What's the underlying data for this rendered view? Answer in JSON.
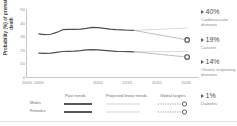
{
  "chart_data": {
    "type": "line",
    "title": "",
    "xlabel": "",
    "ylabel": "Probability (%) of premature death",
    "xlim": [
      1998,
      2027
    ],
    "ylim": [
      0,
      50
    ],
    "grid": false,
    "legend_position": "below",
    "yticks": [
      50,
      40,
      30,
      20,
      10,
      0
    ],
    "xticks": [
      2000,
      2005,
      2010,
      2015,
      2020,
      2025
    ],
    "series": [
      {
        "name": "Males past trends",
        "style": "solid-dark",
        "x": [
          2000,
          2001,
          2002,
          2003,
          2004,
          2005,
          2006,
          2007,
          2008,
          2009,
          2010,
          2011,
          2012,
          2013,
          2014,
          2015,
          2016
        ],
        "values": [
          32.0,
          31.5,
          31.7,
          33.0,
          35.0,
          35.2,
          35.3,
          35.5,
          36.0,
          36.6,
          36.5,
          36.0,
          35.4,
          35.0,
          34.8,
          34.6,
          34.5
        ]
      },
      {
        "name": "Females past trends",
        "style": "solid-dark",
        "x": [
          2000,
          2001,
          2002,
          2003,
          2004,
          2005,
          2006,
          2007,
          2008,
          2009,
          2010,
          2011,
          2012,
          2013,
          2014,
          2015,
          2016
        ],
        "values": [
          18.0,
          17.9,
          18.0,
          18.6,
          19.2,
          19.3,
          19.4,
          19.8,
          20.4,
          20.6,
          20.4,
          20.0,
          19.6,
          19.3,
          19.2,
          19.1,
          19.0
        ]
      },
      {
        "name": "Males projected linear trend",
        "style": "solid-light",
        "x": [
          2016,
          2025
        ],
        "values": [
          34.5,
          36.2
        ]
      },
      {
        "name": "Females projected linear trend",
        "style": "solid-light",
        "x": [
          2016,
          2025
        ],
        "values": [
          19.0,
          19.2
        ]
      },
      {
        "name": "Males global target",
        "style": "dotted",
        "x": [
          2016,
          2025
        ],
        "values": [
          34.5,
          27.6
        ]
      },
      {
        "name": "Females global target",
        "style": "dotted",
        "x": [
          2016,
          2025
        ],
        "values": [
          19.0,
          15.2
        ]
      }
    ],
    "target_markers": [
      {
        "name": "Males global target marker",
        "x": 2025,
        "y": 27.6
      },
      {
        "name": "Females global target marker",
        "x": 2025,
        "y": 15.2
      }
    ]
  },
  "legend": {
    "headers": [
      "Past trends",
      "Projected linear trends",
      "Global targets"
    ],
    "rows": [
      "Males",
      "Females"
    ]
  },
  "stats": [
    {
      "value": "40%",
      "label": "Cardiovascular diseases"
    },
    {
      "value": "19%",
      "label": "Cancers"
    },
    {
      "value": "14%",
      "label": "Chronic respiratory diseases"
    },
    {
      "value": "1%",
      "label": "Diabetes"
    }
  ],
  "colors": {
    "dark_line": "#4f4f4f",
    "light_line": "#bdbdbd",
    "axis": "#c9c9c9",
    "tick_text": "#8d8d8d",
    "marker_ring": "#4f4f4f"
  }
}
